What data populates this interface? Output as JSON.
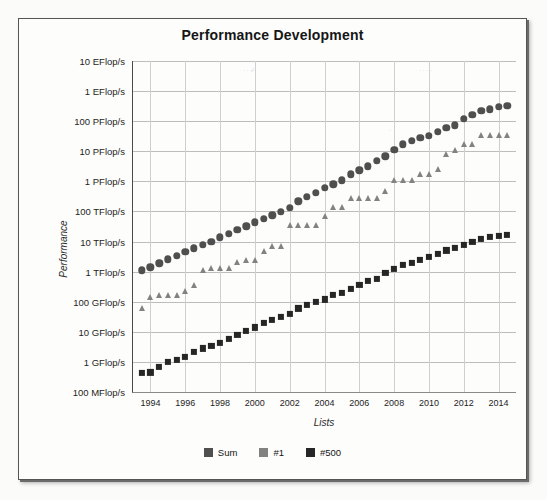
{
  "chart_data": {
    "type": "scatter",
    "title": "Performance Development",
    "xlabel": "Lists",
    "ylabel": "Performance",
    "grid": true,
    "legend_position": "bottom",
    "log_scale_y": true,
    "xlim": [
      1993,
      2015
    ],
    "ylim_flops": [
      100000000.0,
      1e+19
    ],
    "x_ticks": [
      "1994",
      "1996",
      "1998",
      "2000",
      "2002",
      "2004",
      "2006",
      "2008",
      "2010",
      "2012",
      "2014"
    ],
    "x_tick_values": [
      1994,
      1996,
      1998,
      2000,
      2002,
      2004,
      2006,
      2008,
      2010,
      2012,
      2014
    ],
    "y_ticks": [
      "10 EFlop/s",
      "1 EFlop/s",
      "100 PFlop/s",
      "10 PFlop/s",
      "1 PFlop/s",
      "100 TFlop/s",
      "10 TFlop/s",
      "1 TFlop/s",
      "100 GFlop/s",
      "10 GFlop/s",
      "1 GFlop/s",
      "100 MFlop/s"
    ],
    "y_tick_values": [
      1e+19,
      1e+18,
      1e+17,
      1e+16,
      1000000000000000.0,
      100000000000000.0,
      10000000000000.0,
      1000000000000.0,
      100000000000.0,
      10000000000.0,
      1000000000.0,
      100000000.0
    ],
    "series": [
      {
        "name": "Sum",
        "marker": "circle",
        "color": "#4f4f4f",
        "x": [
          1993.5,
          1994.0,
          1994.5,
          1995.0,
          1995.5,
          1996.0,
          1996.5,
          1997.0,
          1997.5,
          1998.0,
          1998.5,
          1999.0,
          1999.5,
          2000.0,
          2000.5,
          2001.0,
          2001.5,
          2002.0,
          2002.5,
          2003.0,
          2003.5,
          2004.0,
          2004.5,
          2005.0,
          2005.5,
          2006.0,
          2006.5,
          2007.0,
          2007.5,
          2008.0,
          2008.5,
          2009.0,
          2009.5,
          2010.0,
          2010.5,
          2011.0,
          2011.5,
          2012.0,
          2012.5,
          2013.0,
          2013.5,
          2014.0,
          2014.5
        ],
        "values": [
          1100000000000.0,
          1400000000000.0,
          1900000000000.0,
          2600000000000.0,
          3400000000000.0,
          4500000000000.0,
          5900000000000.0,
          7800000000000.0,
          10000000000000.0,
          14000000000000.0,
          18000000000000.0,
          24000000000000.0,
          32000000000000.0,
          43000000000000.0,
          56000000000000.0,
          74000000000000.0,
          98000000000000.0,
          130000000000000.0,
          220000000000000.0,
          300000000000000.0,
          410000000000000.0,
          600000000000000.0,
          800000000000000.0,
          1100000000000000.0,
          1700000000000000.0,
          2300000000000000.0,
          3200000000000000.0,
          4900000000000000.0,
          6900000000000000.0,
          1.1e+16,
          1.7e+16,
          2.2e+16,
          2.8e+16,
          3.3e+16,
          4.4e+16,
          5.9e+16,
          7.4e+16,
          1.2e+17,
          1.6e+17,
          2.2e+17,
          2.5e+17,
          3e+17,
          3.3e+17
        ]
      },
      {
        "name": "#1",
        "marker": "triangle",
        "color": "#828282",
        "x": [
          1993.5,
          1994.0,
          1994.5,
          1995.0,
          1995.5,
          1996.0,
          1996.5,
          1997.0,
          1997.5,
          1998.0,
          1998.5,
          1999.0,
          1999.5,
          2000.0,
          2000.5,
          2001.0,
          2001.5,
          2002.0,
          2002.5,
          2003.0,
          2003.5,
          2004.0,
          2004.5,
          2005.0,
          2005.5,
          2006.0,
          2006.5,
          2007.0,
          2007.5,
          2008.0,
          2008.5,
          2009.0,
          2009.5,
          2010.0,
          2010.5,
          2011.0,
          2011.5,
          2012.0,
          2012.5,
          2013.0,
          2013.5,
          2014.0,
          2014.5
        ],
        "values": [
          60000000000.0,
          140000000000.0,
          170000000000.0,
          170000000000.0,
          170000000000.0,
          220000000000.0,
          370000000000.0,
          1100000000000.0,
          1300000000000.0,
          1300000000000.0,
          1300000000000.0,
          2100000000000.0,
          2400000000000.0,
          2400000000000.0,
          4900000000000.0,
          7200000000000.0,
          7200000000000.0,
          36000000000000.0,
          36000000000000.0,
          36000000000000.0,
          36000000000000.0,
          71000000000000.0,
          140000000000000.0,
          140000000000000.0,
          280000000000000.0,
          280000000000000.0,
          280000000000000.0,
          280000000000000.0,
          480000000000000.0,
          1100000000000000.0,
          1100000000000000.0,
          1100000000000000.0,
          1800000000000000.0,
          1800000000000000.0,
          2600000000000000.0,
          8200000000000000.0,
          1.1e+16,
          1.8e+16,
          1.8e+16,
          3.4e+16,
          3.4e+16,
          3.4e+16,
          3.4e+16
        ]
      },
      {
        "name": "#500",
        "marker": "square",
        "color": "#262626",
        "x": [
          1993.5,
          1994.0,
          1994.5,
          1995.0,
          1995.5,
          1996.0,
          1996.5,
          1997.0,
          1997.5,
          1998.0,
          1998.5,
          1999.0,
          1999.5,
          2000.0,
          2000.5,
          2001.0,
          2001.5,
          2002.0,
          2002.5,
          2003.0,
          2003.5,
          2004.0,
          2004.5,
          2005.0,
          2005.5,
          2006.0,
          2006.5,
          2007.0,
          2007.5,
          2008.0,
          2008.5,
          2009.0,
          2009.5,
          2010.0,
          2010.5,
          2011.0,
          2011.5,
          2012.0,
          2012.5,
          2013.0,
          2013.5,
          2014.0,
          2014.5
        ],
        "values": [
          420000000.0,
          450000000.0,
          700000000.0,
          1000000000.0,
          1200000000.0,
          1500000000.0,
          2100000000.0,
          2800000000.0,
          3400000000.0,
          4400000000.0,
          5800000000.0,
          8000000000.0,
          11000000000.0,
          14000000000.0,
          20000000000.0,
          25000000000.0,
          31000000000.0,
          40000000000.0,
          60000000000.0,
          80000000000.0,
          100000000000.0,
          120000000000.0,
          170000000000.0,
          200000000000.0,
          270000000000.0,
          360000000000.0,
          480000000000.0,
          590000000000.0,
          900000000000.0,
          1200000000000.0,
          1700000000000.0,
          2000000000000.0,
          2400000000000.0,
          3100000000000.0,
          4000000000000.0,
          5100000000000.0,
          6100000000000.0,
          7600000000000.0,
          9600000000000.0,
          12000000000000.0,
          14000000000000.0,
          15000000000000.0,
          17000000000000.0
        ]
      }
    ]
  },
  "legend": {
    "items": [
      {
        "label": "Sum",
        "color": "#4f4f4f"
      },
      {
        "label": "#1",
        "color": "#828282"
      },
      {
        "label": "#500",
        "color": "#262626"
      }
    ]
  }
}
